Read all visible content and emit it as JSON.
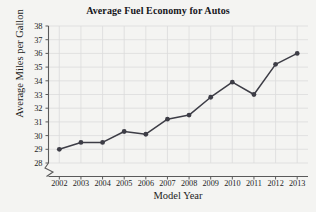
{
  "chart_data": {
    "type": "line",
    "title": "Average Fuel Economy for Autos",
    "xlabel": "Model Year",
    "ylabel": "Average Miles per Gallon",
    "categories": [
      "2002",
      "2003",
      "2004",
      "2005",
      "2006",
      "2007",
      "2008",
      "2009",
      "2010",
      "2011",
      "2012",
      "2013"
    ],
    "values": [
      29.0,
      29.5,
      29.5,
      30.3,
      30.1,
      31.2,
      31.5,
      32.8,
      33.9,
      33.0,
      35.2,
      36.0
    ],
    "ylim": [
      28,
      38
    ],
    "ytick_labels": [
      "38",
      "37",
      "36",
      "35",
      "34",
      "33",
      "32",
      "31",
      "30",
      "29",
      "28"
    ],
    "ytick_values": [
      38,
      37,
      36,
      35,
      34,
      33,
      32,
      31,
      30,
      29,
      28
    ],
    "y_axis_break": true,
    "grid": "both",
    "legend": "none",
    "series_color": "#3d3d46",
    "marker": "circle",
    "grid_color": "#dcdcdc",
    "axis_color": "#5a5a5a",
    "background_color": "#f4f4f2"
  }
}
